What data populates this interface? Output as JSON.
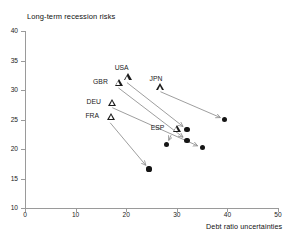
{
  "chart_data": {
    "type": "scatter",
    "title": "Long-term recession risks",
    "xlabel": "Debt ratio uncertainties",
    "ylabel": "Long-term recession risks",
    "xlim": [
      0,
      50
    ],
    "ylim": [
      10,
      40
    ],
    "xticks": [
      0,
      10,
      20,
      30,
      40,
      50
    ],
    "yticks": [
      10,
      15,
      20,
      25,
      30,
      35,
      40
    ],
    "grid": false,
    "legend": null,
    "marker_semantics": {
      "triangle": "start value (open triangle)",
      "circle": "end value (filled circle)",
      "arrow": "transition from start to end"
    },
    "points": [
      {
        "label": "USA",
        "start_x": 19.5,
        "start_y": 32.2,
        "end_x": 32.0,
        "end_y": 23.3
      },
      {
        "label": "GBR",
        "start_x": 17.8,
        "start_y": 31.3,
        "end_x": 32.0,
        "end_y": 21.5
      },
      {
        "label": "JPN",
        "start_x": 26.0,
        "start_y": 30.5,
        "end_x": 39.5,
        "end_y": 25.0
      },
      {
        "label": "DEU",
        "start_x": 16.5,
        "start_y": 27.8,
        "end_x": 35.0,
        "end_y": 20.2
      },
      {
        "label": "FRA",
        "start_x": 16.3,
        "start_y": 25.5,
        "end_x": 24.5,
        "end_y": 16.6
      },
      {
        "label": "ESP",
        "start_x": 29.2,
        "start_y": 23.5,
        "end_x": 28.0,
        "end_y": 20.7
      }
    ],
    "colors": {
      "marker_fill": "#151515",
      "axis": "#9a9a9a",
      "arrow": "#8c8c8c",
      "text": "#1a1a1a"
    }
  },
  "axis": {
    "x_tick_labels": [
      "0",
      "10",
      "20",
      "30",
      "40",
      "50"
    ],
    "y_tick_labels": [
      "10",
      "15",
      "20",
      "25",
      "30",
      "35",
      "40"
    ],
    "x_title": "Debt ratio uncertainties",
    "y_title": "Long-term recession risks"
  }
}
